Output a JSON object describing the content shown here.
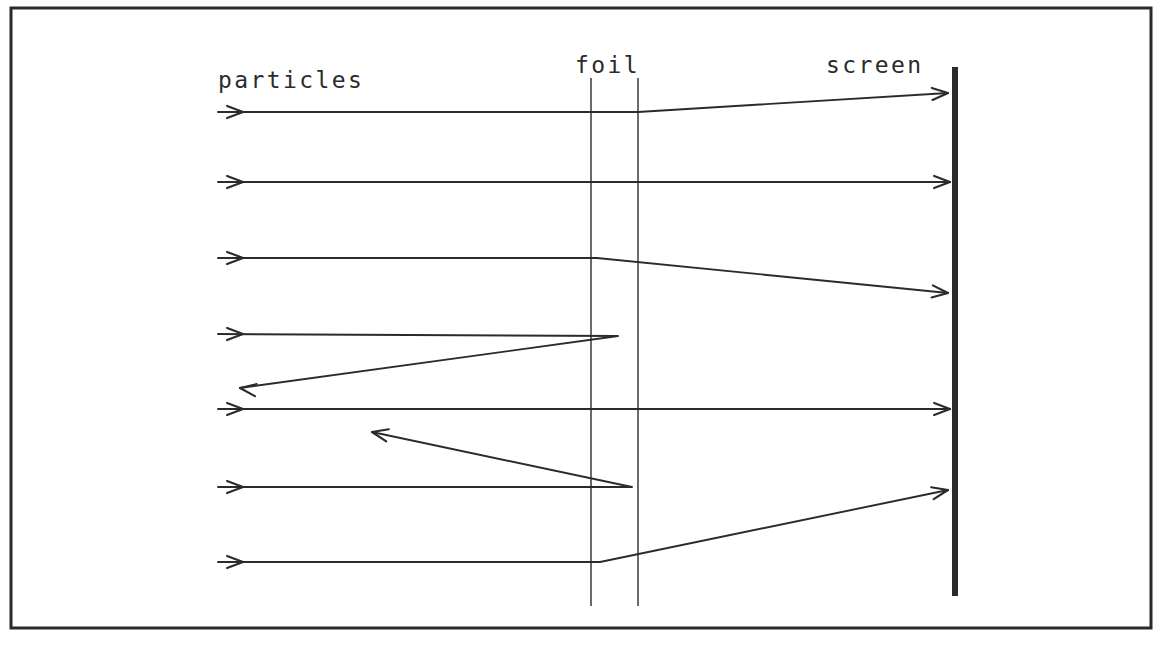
{
  "figure": {
    "background_color": "#ffffff",
    "ink_color": "#2b2b2b",
    "labels": {
      "particles": "particles",
      "foil": "foil",
      "screen": "screen"
    },
    "label_positions": {
      "particles": {
        "x": 218,
        "y": 88
      },
      "foil": {
        "x": 575,
        "y": 73
      },
      "screen": {
        "x": 826,
        "y": 73
      }
    },
    "frame": {
      "x": 11,
      "y": 8,
      "width": 1140,
      "height": 620,
      "stroke_width": 3
    },
    "foil": {
      "line1_x": 591,
      "line2_x": 638,
      "top_y": 78,
      "bottom_y": 606,
      "stroke_width": 1.4
    },
    "screen": {
      "x": 955,
      "top_y": 67,
      "bottom_y": 596,
      "stroke_width": 6
    },
    "beam_start_x": 218,
    "rays": [
      {
        "id": "ray-1-small-deflection-up",
        "incoming_y": 112,
        "description": "passes foil, small upward deflection, hits screen high",
        "points": "218,112 638,112 948,93",
        "arrowheads": [
          {
            "x": 243,
            "y": 112,
            "angle": 0
          },
          {
            "x": 948,
            "y": 93,
            "angle": -3.5
          }
        ]
      },
      {
        "id": "ray-2-undeflected",
        "incoming_y": 182,
        "description": "passes straight through foil to screen",
        "points": "218,182 950,182",
        "arrowheads": [
          {
            "x": 243,
            "y": 182,
            "angle": 0
          },
          {
            "x": 950,
            "y": 182,
            "angle": 0
          }
        ]
      },
      {
        "id": "ray-3-small-deflection-down",
        "incoming_y": 258,
        "description": "passes foil, small downward deflection, hits screen low",
        "points": "218,258 597,258 948,293",
        "arrowheads": [
          {
            "x": 243,
            "y": 258,
            "angle": 0
          },
          {
            "x": 948,
            "y": 293,
            "angle": 5.7
          }
        ]
      },
      {
        "id": "ray-4-backscattered-down",
        "incoming_y": 334,
        "description": "strikes nucleus in foil, backscatters down and to the left",
        "points": "218,334 618,336 240,388",
        "arrowheads": [
          {
            "x": 243,
            "y": 334,
            "angle": 0
          },
          {
            "x": 240,
            "y": 388,
            "angle": 187.8
          }
        ]
      },
      {
        "id": "ray-5-undeflected",
        "incoming_y": 409,
        "description": "passes straight through foil to screen",
        "points": "218,409 950,409",
        "arrowheads": [
          {
            "x": 243,
            "y": 409,
            "angle": 0
          },
          {
            "x": 950,
            "y": 409,
            "angle": 0
          }
        ]
      },
      {
        "id": "ray-6-backscattered-up",
        "incoming_y": 487,
        "description": "strikes nucleus in foil, backscatters up and to the left",
        "points": "218,487 632,487 372,432",
        "arrowheads": [
          {
            "x": 243,
            "y": 487,
            "angle": 0
          },
          {
            "x": 372,
            "y": 432,
            "angle": 192
          }
        ]
      },
      {
        "id": "ray-7-large-deflection-up",
        "incoming_y": 562,
        "description": "passes foil, large upward deflection, hits screen mid",
        "points": "218,562 600,562 948,490",
        "arrowheads": [
          {
            "x": 243,
            "y": 562,
            "angle": 0
          },
          {
            "x": 948,
            "y": 490,
            "angle": -11.7
          }
        ]
      }
    ]
  }
}
